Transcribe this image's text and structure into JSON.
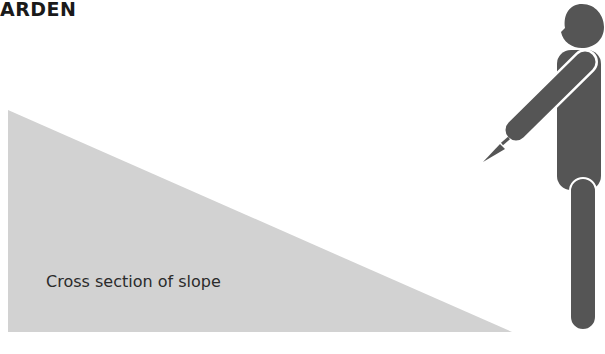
{
  "header": {
    "title": "ARDEN"
  },
  "diagram": {
    "slope_label": "Cross section of slope",
    "colors": {
      "slope": "#d2d2d2",
      "figure": "#555555",
      "text": "#2b2b2b"
    }
  }
}
